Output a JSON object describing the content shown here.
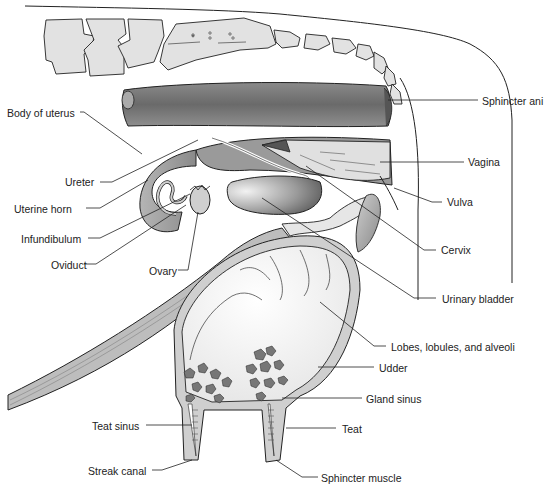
{
  "diagram": {
    "labels_left": [
      {
        "id": "body-of-uterus",
        "text": "Body of uterus",
        "x": 7,
        "y": 107
      },
      {
        "id": "ureter",
        "text": "Ureter",
        "x": 65,
        "y": 176
      },
      {
        "id": "uterine-horn",
        "text": "Uterine horn",
        "x": 14,
        "y": 203
      },
      {
        "id": "infundibulum",
        "text": "Infundibulum",
        "x": 21,
        "y": 233
      },
      {
        "id": "oviduct",
        "text": "Oviduct",
        "x": 51,
        "y": 260
      },
      {
        "id": "ovary",
        "text": "Ovary",
        "x": 149,
        "y": 266
      },
      {
        "id": "teat-sinus",
        "text": "Teat sinus",
        "x": 92,
        "y": 421
      },
      {
        "id": "streak-canal",
        "text": "Streak canal",
        "x": 88,
        "y": 466
      }
    ],
    "labels_right": [
      {
        "id": "sphincter-ani",
        "text": "Sphincter ani",
        "x": 482,
        "y": 96
      },
      {
        "id": "vagina",
        "text": "Vagina",
        "x": 468,
        "y": 157
      },
      {
        "id": "vulva",
        "text": "Vulva",
        "x": 447,
        "y": 197
      },
      {
        "id": "cervix",
        "text": "Cervix",
        "x": 441,
        "y": 245
      },
      {
        "id": "urinary-bladder",
        "text": "Urinary bladder",
        "x": 442,
        "y": 294
      },
      {
        "id": "lobes-lobules-alveoli",
        "text": "Lobes, lobules, and alveoli",
        "x": 391,
        "y": 342
      },
      {
        "id": "udder",
        "text": "Udder",
        "x": 379,
        "y": 363
      },
      {
        "id": "gland-sinus",
        "text": "Gland sinus",
        "x": 366,
        "y": 394
      },
      {
        "id": "teat",
        "text": "Teat",
        "x": 342,
        "y": 424
      },
      {
        "id": "sphincter-muscle",
        "text": "Sphincter muscle",
        "x": 321,
        "y": 473
      }
    ],
    "colors": {
      "line": "#222222",
      "tissue_dark": "#6f6f6f",
      "tissue_mid": "#9a9a9a",
      "tissue_light": "#cfcfcf",
      "bone": "#e2e2e2",
      "background": "#ffffff"
    }
  }
}
